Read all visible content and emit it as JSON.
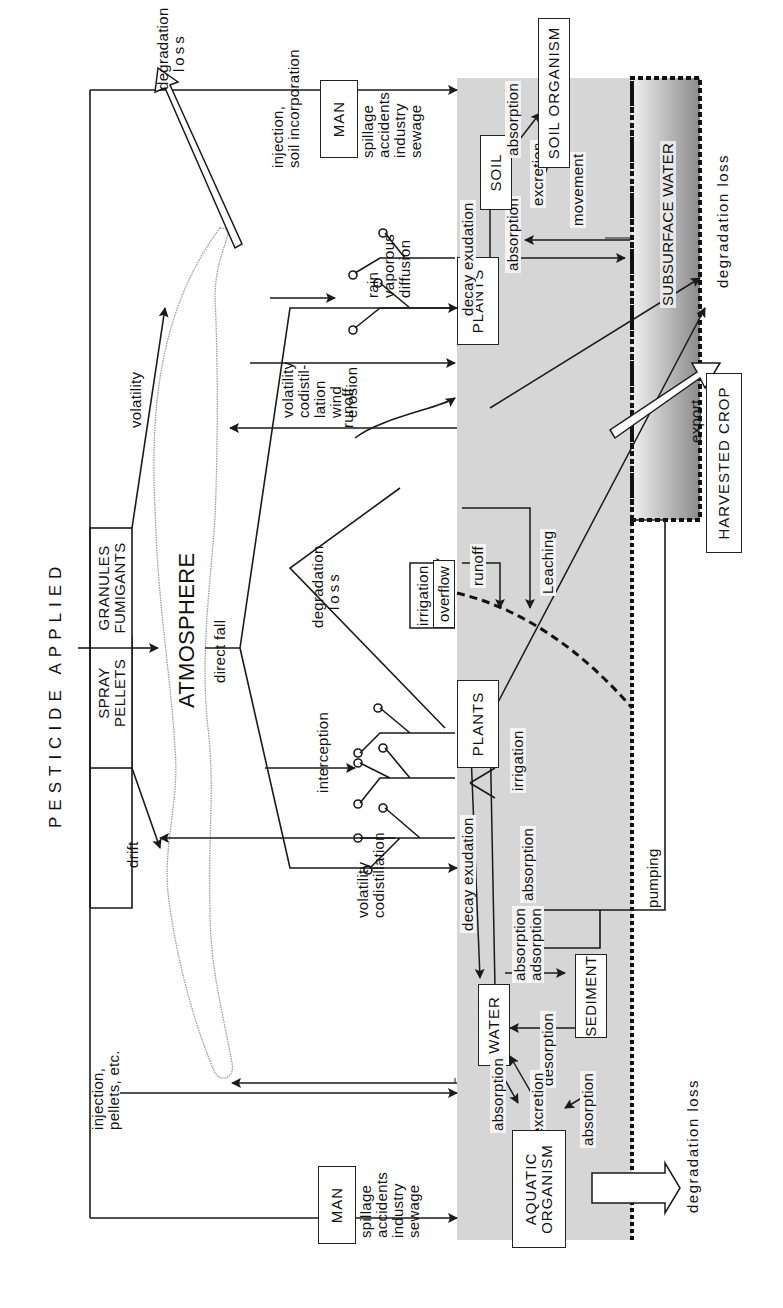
{
  "title": "PESTICIDE APPLIED",
  "application_forms": {
    "left": {
      "line1": "SPRAY",
      "line2": "PELLETS"
    },
    "right": {
      "line1": "GRANULES",
      "line2": "FUMIGANTS"
    }
  },
  "atmosphere": {
    "label": "ATMOSPHERE",
    "direct_fall": "direct fall"
  },
  "compartments": {
    "man_left": "MAN",
    "man_right": "MAN",
    "aquatic_organism": {
      "line1": "AQUATIC",
      "line2": "ORGANISM"
    },
    "water": "WATER",
    "sediment": "SEDIMENT",
    "plants_left": "PLANTS",
    "plants_right": "PLANTS",
    "soil": "SOIL",
    "soil_organism": "SOIL ORGANISM",
    "harvested_crop": "HARVESTED CROP",
    "subsurface_water": "SUBSURFACE WATER",
    "overflow": "overflow"
  },
  "flows": {
    "drift": "drift",
    "volatility_top": "volatility",
    "degradation_loss_atmosphere": {
      "line1": "degradation",
      "line2": "loss"
    },
    "injection_pellets": {
      "line1": "injection,",
      "line2": "pellets, etc."
    },
    "injection_soil": {
      "line1": "injection,",
      "line2": "soil incorporation"
    },
    "man_sources": {
      "line1": "spillage",
      "line2": "accidents",
      "line3": ",",
      "line4": "industry",
      "line5": "sewage"
    },
    "volatility_codistillation": {
      "line1": "volatility",
      "line2": "codistillation"
    },
    "volatility_wind": {
      "line1": "volatility",
      "line2": "codistil-",
      "line3": "lation",
      "line4": "wind",
      "line5": "erosion"
    },
    "rain_vaporous": {
      "line1": "rain",
      "line2": "vaporous",
      "line3": "diffusion"
    },
    "interception": "interception",
    "degradation_loss_mid": {
      "line1": "degradation",
      "line2": "loss"
    },
    "irrigation_top": "irrigation",
    "runoff_plants": "runoff",
    "runoff_ground": "runoff",
    "leaching": "Leaching",
    "decay_exudation_water": "decay exudation",
    "decay_exudation_soil": "decay exudation",
    "absorption_water_plants": "absorption",
    "irrigation_ground": "irrigation",
    "absorption_soil_plants": "absorption",
    "absorption_soil_org": "absorption",
    "excretion_soil": "excretion",
    "movement": "movement",
    "absorption_adsorption": {
      "line1": "absorption",
      "line2": "adsorption"
    },
    "desorption": "desorption",
    "absorption_aquatic_1": "absorption",
    "excretion_aquatic": "excretion",
    "absorption_aquatic_2": "absorption",
    "pumping": "pumping",
    "export": "export",
    "degradation_loss_subsurface": "degradation loss",
    "degradation_loss_aquatic": "degradation loss"
  },
  "colors": {
    "ground_shade": "#d4d4d4",
    "subsurface_dark": "#8e8e8e",
    "line": "#1a1a1a",
    "cloud_outline": "#9a9a9a"
  }
}
